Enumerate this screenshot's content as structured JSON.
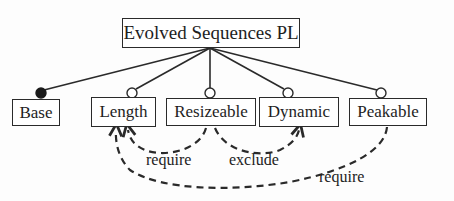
{
  "diagram": {
    "type": "feature-model",
    "root": {
      "label": "Evolved Sequences PL"
    },
    "features": [
      {
        "id": "base",
        "label": "Base",
        "kind": "mandatory"
      },
      {
        "id": "length",
        "label": "Length",
        "kind": "optional"
      },
      {
        "id": "resizeable",
        "label": "Resizeable",
        "kind": "optional"
      },
      {
        "id": "dynamic",
        "label": "Dynamic",
        "kind": "optional"
      },
      {
        "id": "peakable",
        "label": "Peakable",
        "kind": "optional"
      }
    ],
    "constraints": [
      {
        "from": "Resizeable",
        "to": "Length",
        "label": "require"
      },
      {
        "from": "Resizeable",
        "to": "Dynamic",
        "label": "exclude"
      },
      {
        "from": "Peakable",
        "to": "Length",
        "label": "require"
      }
    ],
    "colors": {
      "line": "#2a2a2a",
      "text": "#1e1e1e",
      "background": "#ffffff"
    }
  }
}
